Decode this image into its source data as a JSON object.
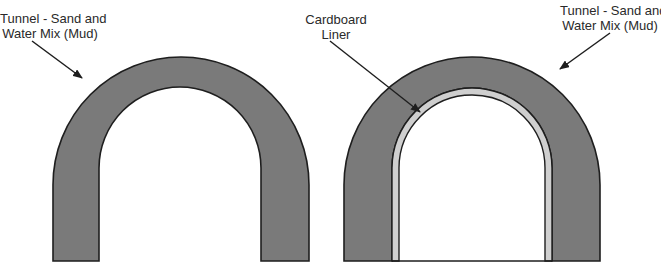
{
  "diagram": {
    "type": "tunnel-cross-section-comparison",
    "colors": {
      "mud_fill": "#7a7a7a",
      "liner_fill": "#cfcfcf",
      "outline": "#1e1e1e",
      "background": "#ffffff",
      "text": "#2a2a2a"
    },
    "left_tunnel": {
      "label_line1": "Tunnel - Sand and",
      "label_line2": "Water Mix (Mud)"
    },
    "right_tunnel": {
      "liner_label_line1": "Cardboard",
      "liner_label_line2": "Liner",
      "label_line1": "Tunnel - Sand and",
      "label_line2": "Water Mix (Mud)"
    }
  }
}
